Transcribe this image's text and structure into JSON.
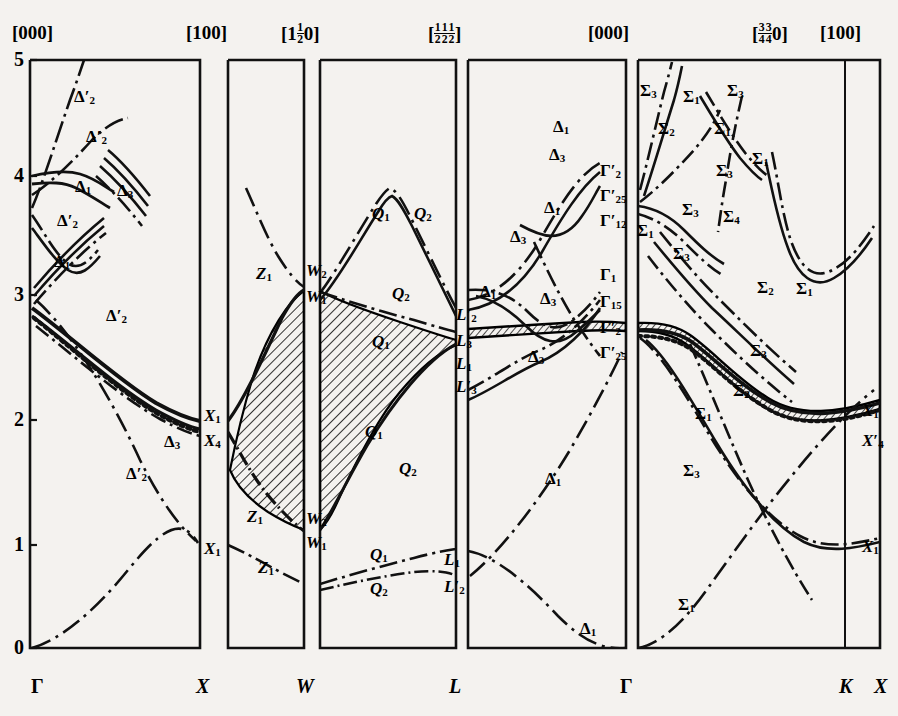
{
  "figure": {
    "type": "band-structure",
    "title": "",
    "axis": {
      "ylabel": "",
      "yticks": [
        "0",
        "1",
        "2",
        "3",
        "4",
        "5"
      ],
      "ylim": [
        0,
        5
      ],
      "ytick_values": [
        0,
        1,
        2,
        3,
        4,
        5
      ]
    },
    "top_labels": [
      {
        "id": "t-000-a",
        "text": "[000]",
        "x": 12,
        "y": 22
      },
      {
        "id": "t-100-a",
        "text": "[100]",
        "x": 186,
        "y": 22
      },
      {
        "id": "t-1half0",
        "text": "[1½0]",
        "x": 281,
        "y": 22
      },
      {
        "id": "t-halves",
        "text": "[½½½]",
        "x": 428,
        "y": 22
      },
      {
        "id": "t-000-b",
        "text": "[000]",
        "x": 588,
        "y": 22
      },
      {
        "id": "t-3340",
        "text": "[¾¾0]",
        "x": 752,
        "y": 22
      },
      {
        "id": "t-100-b",
        "text": "[100]",
        "x": 820,
        "y": 22
      }
    ],
    "bottom_labels": [
      {
        "id": "b-gamma-1",
        "text": "Γ",
        "x": 31,
        "y": 675
      },
      {
        "id": "b-x-1",
        "text": "X",
        "x": 196,
        "y": 675
      },
      {
        "id": "b-w",
        "text": "W",
        "x": 296,
        "y": 675
      },
      {
        "id": "b-l",
        "text": "L",
        "x": 449,
        "y": 675
      },
      {
        "id": "b-gamma-2",
        "text": "Γ",
        "x": 620,
        "y": 675
      },
      {
        "id": "b-k",
        "text": "K",
        "x": 839,
        "y": 675
      },
      {
        "id": "b-x-2",
        "text": "X",
        "x": 874,
        "y": 675
      }
    ],
    "panels": [
      {
        "name": "gamma-x",
        "x0": 30,
        "x1": 200
      },
      {
        "name": "x-w",
        "x0": 228,
        "x1": 304
      },
      {
        "name": "w-l",
        "x0": 320,
        "x1": 456
      },
      {
        "name": "l-gamma",
        "x0": 468,
        "x1": 626
      },
      {
        "name": "gamma-k-x",
        "x0": 638,
        "x1": 880,
        "inner_divider": 845
      }
    ],
    "band_labels": [
      {
        "id": "d2p-1",
        "sym": "Δ",
        "prime": true,
        "sub": "2",
        "x": 74,
        "y": 88
      },
      {
        "id": "d2p-2",
        "sym": "Δ",
        "prime": true,
        "sub": "2",
        "x": 86,
        "y": 128
      },
      {
        "id": "d1-1",
        "sym": "Δ",
        "prime": false,
        "sub": "1",
        "x": 75,
        "y": 178
      },
      {
        "id": "d3-1",
        "sym": "Δ",
        "prime": false,
        "sub": "3",
        "x": 117,
        "y": 182
      },
      {
        "id": "d2p-3",
        "sym": "Δ",
        "prime": true,
        "sub": "2",
        "x": 57,
        "y": 212
      },
      {
        "id": "d1-2",
        "sym": "Δ",
        "prime": false,
        "sub": "1",
        "x": 54,
        "y": 253
      },
      {
        "id": "d2p-4",
        "sym": "Δ",
        "prime": true,
        "sub": "2",
        "x": 106,
        "y": 307
      },
      {
        "id": "d3-2",
        "sym": "Δ",
        "prime": false,
        "sub": "3",
        "x": 164,
        "y": 433
      },
      {
        "id": "d2p-5",
        "sym": "Δ",
        "prime": true,
        "sub": "2",
        "x": 126,
        "y": 465
      },
      {
        "id": "x1-a",
        "sym": "X",
        "prime": false,
        "sub": "1",
        "x": 204,
        "y": 407
      },
      {
        "id": "x4-a",
        "sym": "X",
        "prime": false,
        "sub": "4",
        "x": 204,
        "y": 432
      },
      {
        "id": "x1-b",
        "sym": "X",
        "prime": false,
        "sub": "1",
        "x": 204,
        "y": 540
      },
      {
        "id": "z1-1",
        "sym": "Z",
        "prime": false,
        "sub": "1",
        "x": 256,
        "y": 265
      },
      {
        "id": "z1-2",
        "sym": "Z",
        "prime": false,
        "sub": "1",
        "x": 247,
        "y": 508
      },
      {
        "id": "z1-3",
        "sym": "Z",
        "prime": false,
        "sub": "1",
        "x": 258,
        "y": 559
      },
      {
        "id": "w2-a",
        "sym": "W",
        "prime": false,
        "sub": "2",
        "x": 306,
        "y": 262
      },
      {
        "id": "w1-a",
        "sym": "W",
        "prime": false,
        "sub": "1",
        "x": 306,
        "y": 288
      },
      {
        "id": "w2-b",
        "sym": "W",
        "prime": false,
        "sub": "2",
        "x": 306,
        "y": 510
      },
      {
        "id": "w1-b",
        "sym": "W",
        "prime": false,
        "sub": "1",
        "x": 306,
        "y": 534
      },
      {
        "id": "q1-1",
        "sym": "Q",
        "prime": false,
        "sub": "1",
        "x": 372,
        "y": 205
      },
      {
        "id": "q2-1",
        "sym": "Q",
        "prime": false,
        "sub": "2",
        "x": 414,
        "y": 205
      },
      {
        "id": "q2-2",
        "sym": "Q",
        "prime": false,
        "sub": "2",
        "x": 392,
        "y": 285
      },
      {
        "id": "q1-2",
        "sym": "Q",
        "prime": false,
        "sub": "1",
        "x": 372,
        "y": 333
      },
      {
        "id": "q1-3",
        "sym": "Q",
        "prime": false,
        "sub": "1",
        "x": 365,
        "y": 423
      },
      {
        "id": "q2-3",
        "sym": "Q",
        "prime": false,
        "sub": "2",
        "x": 399,
        "y": 460
      },
      {
        "id": "q1-4",
        "sym": "Q",
        "prime": false,
        "sub": "1",
        "x": 370,
        "y": 546
      },
      {
        "id": "q2-4",
        "sym": "Q",
        "prime": false,
        "sub": "2",
        "x": 370,
        "y": 580
      },
      {
        "id": "l2p",
        "sym": "L",
        "prime": true,
        "sub": "2",
        "x": 456,
        "y": 306
      },
      {
        "id": "l3",
        "sym": "L",
        "prime": false,
        "sub": "3",
        "x": 456,
        "y": 332
      },
      {
        "id": "l1",
        "sym": "L",
        "prime": false,
        "sub": "1",
        "x": 456,
        "y": 355
      },
      {
        "id": "l3p",
        "sym": "L",
        "prime": true,
        "sub": "3",
        "x": 456,
        "y": 378
      },
      {
        "id": "l1-b",
        "sym": "L",
        "prime": false,
        "sub": "1",
        "x": 444,
        "y": 551
      },
      {
        "id": "l2p-b",
        "sym": "L",
        "prime": true,
        "sub": "2",
        "x": 444,
        "y": 578
      },
      {
        "id": "dd1-1",
        "sym": "Δ",
        "prime": false,
        "sub": "1",
        "x": 553,
        "y": 118
      },
      {
        "id": "dd3-1",
        "sym": "Δ",
        "prime": false,
        "sub": "3",
        "x": 549,
        "y": 146
      },
      {
        "id": "dd1-2",
        "sym": "Δ",
        "prime": false,
        "sub": "1",
        "x": 544,
        "y": 199
      },
      {
        "id": "dd3-2",
        "sym": "Δ",
        "prime": false,
        "sub": "3",
        "x": 510,
        "y": 228
      },
      {
        "id": "dd1-3",
        "sym": "Δ",
        "prime": false,
        "sub": "1",
        "x": 480,
        "y": 283
      },
      {
        "id": "dd3-3",
        "sym": "Δ",
        "prime": false,
        "sub": "3",
        "x": 540,
        "y": 290
      },
      {
        "id": "dd3-4",
        "sym": "Δ",
        "prime": false,
        "sub": "3",
        "x": 528,
        "y": 348
      },
      {
        "id": "dd1-4",
        "sym": "Δ",
        "prime": false,
        "sub": "1",
        "x": 545,
        "y": 470
      },
      {
        "id": "dd1-5",
        "sym": "Δ",
        "prime": false,
        "sub": "1",
        "x": 580,
        "y": 620
      },
      {
        "id": "g2p",
        "sym": "Γ",
        "prime": true,
        "sub": "2",
        "x": 600,
        "y": 162
      },
      {
        "id": "g25p",
        "sym": "Γ",
        "prime": true,
        "sub": "25",
        "x": 600,
        "y": 187
      },
      {
        "id": "g12p",
        "sym": "Γ",
        "prime": true,
        "sub": "12",
        "x": 600,
        "y": 212
      },
      {
        "id": "g1",
        "sym": "Γ",
        "prime": false,
        "sub": "1",
        "x": 600,
        "y": 266
      },
      {
        "id": "g15",
        "sym": "Γ",
        "prime": false,
        "sub": "15",
        "x": 600,
        "y": 293
      },
      {
        "id": "g2p-b",
        "sym": "Γ",
        "prime": true,
        "sub": "2",
        "x": 600,
        "y": 319
      },
      {
        "id": "g25p-b",
        "sym": "Γ",
        "prime": true,
        "sub": "25",
        "x": 600,
        "y": 344
      },
      {
        "id": "s3-1",
        "sym": "Σ",
        "prime": false,
        "sub": "3",
        "x": 640,
        "y": 82
      },
      {
        "id": "s1-1",
        "sym": "Σ",
        "prime": false,
        "sub": "1",
        "x": 683,
        "y": 88
      },
      {
        "id": "s3-2",
        "sym": "Σ",
        "prime": false,
        "sub": "3",
        "x": 727,
        "y": 82
      },
      {
        "id": "s2-1",
        "sym": "Σ",
        "prime": false,
        "sub": "2",
        "x": 658,
        "y": 120
      },
      {
        "id": "s1-2",
        "sym": "Σ",
        "prime": false,
        "sub": "1",
        "x": 714,
        "y": 120
      },
      {
        "id": "s1-3",
        "sym": "Σ",
        "prime": false,
        "sub": "1",
        "x": 752,
        "y": 150
      },
      {
        "id": "s3-3",
        "sym": "Σ",
        "prime": false,
        "sub": "3",
        "x": 716,
        "y": 162
      },
      {
        "id": "s3-4",
        "sym": "Σ",
        "prime": false,
        "sub": "3",
        "x": 682,
        "y": 201
      },
      {
        "id": "s4-1",
        "sym": "Σ",
        "prime": false,
        "sub": "4",
        "x": 723,
        "y": 208
      },
      {
        "id": "s1-4",
        "sym": "Σ",
        "prime": false,
        "sub": "1",
        "x": 637,
        "y": 222
      },
      {
        "id": "s3-5",
        "sym": "Σ",
        "prime": false,
        "sub": "3",
        "x": 673,
        "y": 245
      },
      {
        "id": "s2-2",
        "sym": "Σ",
        "prime": false,
        "sub": "2",
        "x": 757,
        "y": 279
      },
      {
        "id": "s1-5",
        "sym": "Σ",
        "prime": false,
        "sub": "1",
        "x": 796,
        "y": 280
      },
      {
        "id": "s3-6",
        "sym": "Σ",
        "prime": false,
        "sub": "3",
        "x": 750,
        "y": 342
      },
      {
        "id": "s2-3",
        "sym": "Σ",
        "prime": false,
        "sub": "2",
        "x": 733,
        "y": 382
      },
      {
        "id": "s1-6",
        "sym": "Σ",
        "prime": false,
        "sub": "1",
        "x": 695,
        "y": 405
      },
      {
        "id": "s3-7",
        "sym": "Σ",
        "prime": false,
        "sub": "3",
        "x": 683,
        "y": 462
      },
      {
        "id": "s1-7",
        "sym": "Σ",
        "prime": false,
        "sub": "1",
        "x": 678,
        "y": 596
      },
      {
        "id": "x1-c",
        "sym": "X",
        "prime": false,
        "sub": "1",
        "x": 862,
        "y": 402
      },
      {
        "id": "x4-c",
        "sym": "X",
        "prime": true,
        "sub": "4",
        "x": 862,
        "y": 432
      },
      {
        "id": "x1-d",
        "sym": "X",
        "prime": false,
        "sub": "1",
        "x": 862,
        "y": 538
      }
    ]
  }
}
